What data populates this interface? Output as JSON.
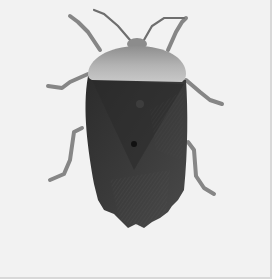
{
  "image": {
    "subject": "shield bug (stink bug), dorsal view",
    "style": "grayscale photograph",
    "colors": {
      "background": "#f2f2f2",
      "border": "#d8d8d8",
      "pronotum": "#9a9a9a",
      "pronotum_highlight": "#c4c4c4",
      "body": "#3c3c3c",
      "body_dark": "#262626",
      "legs": "#8a8a8a"
    }
  }
}
